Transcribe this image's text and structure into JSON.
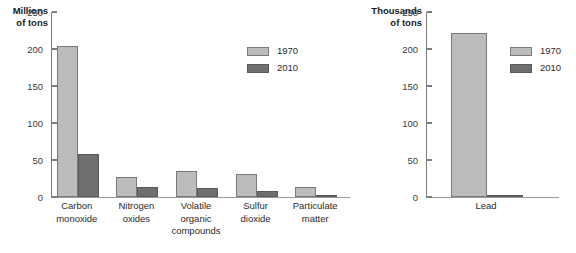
{
  "colors": {
    "series_1970": "#bcbcbc",
    "series_2010": "#6f6f6f",
    "axis": "#7d7d7d",
    "text": "#2b2b2b",
    "background": "#ffffff"
  },
  "chart_data": [
    {
      "type": "bar",
      "title": "",
      "ylabel": "Millions\nof tons",
      "xlabel": "",
      "ylim": [
        0,
        250
      ],
      "yticks": [
        0,
        50,
        100,
        150,
        200,
        250
      ],
      "ytick_labels": [
        "0",
        "50",
        "100",
        "150",
        "200",
        "250"
      ],
      "grid": false,
      "legend_position": "upper right",
      "categories": [
        "Carbon\nmonoxide",
        "Nitrogen\noxides",
        "Volatile\norganic\ncompounds",
        "Sulfur\ndioxide",
        "Particulate\nmatter"
      ],
      "series": [
        {
          "name": "1970",
          "color": "#bcbcbc",
          "values": [
            204,
            27,
            35,
            31,
            14
          ]
        },
        {
          "name": "2010",
          "color": "#6f6f6f",
          "values": [
            58,
            14,
            12,
            8,
            2
          ]
        }
      ]
    },
    {
      "type": "bar",
      "title": "",
      "ylabel": "Thousands\nof tons",
      "xlabel": "",
      "ylim": [
        0,
        250
      ],
      "yticks": [
        0,
        50,
        100,
        150,
        200,
        250
      ],
      "ytick_labels": [
        "0",
        "50",
        "100",
        "150",
        "200",
        "250"
      ],
      "grid": false,
      "legend_position": "upper right",
      "categories": [
        "Lead"
      ],
      "series": [
        {
          "name": "1970",
          "color": "#bcbcbc",
          "values": [
            221
          ]
        },
        {
          "name": "2010",
          "color": "#6f6f6f",
          "values": [
            1
          ]
        }
      ]
    }
  ]
}
